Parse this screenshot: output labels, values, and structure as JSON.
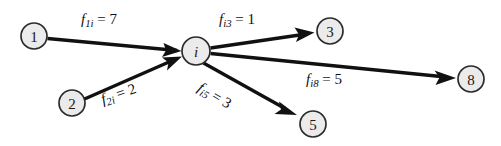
{
  "diagram": {
    "type": "flow-network-node-balance",
    "background_color": "#ffffff",
    "node_fill_color": "#ebebeb",
    "node_stroke_color": "#2b2b2b",
    "edge_color": "#111111",
    "nodes": [
      {
        "id": "1",
        "label": "1",
        "italic": false,
        "cx": 34,
        "cy": 36,
        "r": 13
      },
      {
        "id": "2",
        "label": "2",
        "italic": false,
        "cx": 72,
        "cy": 103,
        "r": 13
      },
      {
        "id": "i",
        "label": "i",
        "italic": true,
        "cx": 196,
        "cy": 51,
        "r": 14
      },
      {
        "id": "3",
        "label": "3",
        "italic": false,
        "cx": 330,
        "cy": 31,
        "r": 13
      },
      {
        "id": "5",
        "label": "5",
        "italic": false,
        "cx": 313,
        "cy": 124,
        "r": 13
      },
      {
        "id": "8",
        "label": "8",
        "italic": false,
        "cx": 471,
        "cy": 79,
        "r": 13
      }
    ],
    "edges": [
      {
        "id": "e1i",
        "from": "1",
        "to": "i",
        "direction": "into-i",
        "flow": 7
      },
      {
        "id": "e2i",
        "from": "2",
        "to": "i",
        "direction": "into-i",
        "flow": 2
      },
      {
        "id": "ei3",
        "from": "i",
        "to": "3",
        "direction": "out-of-i",
        "flow": 1
      },
      {
        "id": "ei5",
        "from": "i",
        "to": "5",
        "direction": "out-of-i",
        "flow": 3
      },
      {
        "id": "ei8",
        "from": "i",
        "to": "8",
        "direction": "out-of-i",
        "flow": 5
      }
    ],
    "labels": [
      {
        "id": "lbl-1i",
        "symbol": "f",
        "subscript": "1i",
        "equals": "=",
        "value": "7",
        "left": 81,
        "top": 12,
        "rotate": 0
      },
      {
        "id": "lbl-2i",
        "symbol": "f",
        "subscript": "2i",
        "equals": "=",
        "value": "2",
        "left": 99,
        "top": 93,
        "rotate": -19
      },
      {
        "id": "lbl-i3",
        "symbol": "f",
        "subscript": "i3",
        "equals": "=",
        "value": "1",
        "left": 219,
        "top": 12,
        "rotate": 0
      },
      {
        "id": "lbl-i5",
        "symbol": "f",
        "subscript": "i5",
        "equals": "=",
        "value": "3",
        "left": 203,
        "top": 80,
        "rotate": 31
      },
      {
        "id": "lbl-i8",
        "symbol": "f",
        "subscript": "i8",
        "equals": "=",
        "value": "5",
        "left": 306,
        "top": 72,
        "rotate": 0
      }
    ]
  }
}
